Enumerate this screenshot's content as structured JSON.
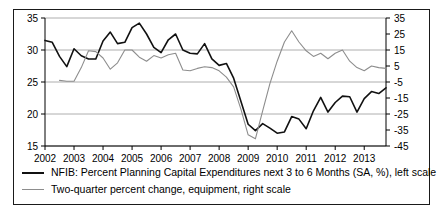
{
  "chart_data": {
    "type": "line",
    "title": "",
    "xlabel": "",
    "ylabel": "",
    "xlim": [
      2002.0,
      2013.75
    ],
    "x_ticks": [
      2002,
      2003,
      2004,
      2005,
      2006,
      2007,
      2008,
      2009,
      2010,
      2011,
      2012,
      2013
    ],
    "x_tick_labels": [
      "2002",
      "2003",
      "2004",
      "2005",
      "2006",
      "2007",
      "2008",
      "2009",
      "2010",
      "2011",
      "2012",
      "2013"
    ],
    "left_axis": {
      "label": "NFIB percent planning capital expenditures (SA, %)",
      "ylim": [
        15,
        35
      ],
      "ticks": [
        15,
        20,
        25,
        30,
        35
      ],
      "tick_labels": [
        "15",
        "20",
        "25",
        "30",
        "35"
      ]
    },
    "right_axis": {
      "label": "Two-quarter percent change, equipment",
      "ylim": [
        -45,
        35
      ],
      "ticks": [
        -45,
        -35,
        -25,
        -15,
        -5,
        5,
        15,
        25,
        35
      ],
      "tick_labels": [
        "-45",
        "-35",
        "-25",
        "-15",
        "-5",
        "5",
        "15",
        "25",
        "35"
      ]
    },
    "grid": "horizontal",
    "legend_position": "below-plot",
    "series": [
      {
        "name": "NFIB: Percent Planning Capital Expenditures next 3 to 6 Months (SA, %), left scale",
        "axis": "left",
        "color": "#111111",
        "x": [
          2002.0,
          2002.25,
          2002.5,
          2002.75,
          2003.0,
          2003.25,
          2003.5,
          2003.75,
          2004.0,
          2004.25,
          2004.5,
          2004.75,
          2005.0,
          2005.25,
          2005.5,
          2005.75,
          2006.0,
          2006.25,
          2006.5,
          2006.75,
          2007.0,
          2007.25,
          2007.5,
          2007.75,
          2008.0,
          2008.25,
          2008.5,
          2008.75,
          2009.0,
          2009.25,
          2009.5,
          2009.75,
          2010.0,
          2010.25,
          2010.5,
          2010.75,
          2011.0,
          2011.25,
          2011.5,
          2011.75,
          2012.0,
          2012.25,
          2012.5,
          2012.75,
          2013.0,
          2013.25,
          2013.5,
          2013.75
        ],
        "values": [
          31.5,
          31.2,
          29.0,
          27.4,
          30.2,
          29.1,
          28.6,
          28.6,
          31.4,
          32.8,
          31.0,
          31.2,
          33.5,
          34.2,
          32.5,
          30.4,
          29.6,
          31.6,
          32.5,
          30.0,
          29.5,
          29.4,
          31.0,
          28.6,
          27.6,
          27.9,
          25.6,
          22.0,
          18.4,
          17.4,
          18.5,
          17.8,
          17.0,
          17.2,
          19.6,
          19.2,
          17.7,
          20.5,
          22.6,
          20.3,
          21.8,
          22.8,
          22.7,
          20.3,
          22.4,
          23.5,
          23.2,
          24.1
        ]
      },
      {
        "name": "Two-quarter percent change, equipment, right scale",
        "axis": "right",
        "color": "#8d8d8d",
        "x": [
          2002.5,
          2002.75,
          2003.0,
          2003.25,
          2003.5,
          2003.75,
          2004.0,
          2004.25,
          2004.5,
          2004.75,
          2005.0,
          2005.25,
          2005.5,
          2005.75,
          2006.0,
          2006.25,
          2006.5,
          2006.75,
          2007.0,
          2007.25,
          2007.5,
          2007.75,
          2008.0,
          2008.25,
          2008.5,
          2008.75,
          2009.0,
          2009.25,
          2009.5,
          2009.75,
          2010.0,
          2010.25,
          2010.5,
          2010.75,
          2011.0,
          2011.25,
          2011.5,
          2011.75,
          2012.0,
          2012.25,
          2012.5,
          2012.75,
          2013.0,
          2013.25,
          2013.5,
          2013.75
        ],
        "values": [
          -4.0,
          -4.5,
          -4.5,
          4.0,
          14.5,
          14.0,
          10.0,
          3.0,
          7.0,
          15.0,
          15.0,
          10.5,
          8.0,
          11.5,
          10.0,
          12.0,
          13.0,
          2.5,
          2.0,
          3.5,
          4.5,
          4.0,
          2.0,
          -2.0,
          -8.0,
          -22.0,
          -38.0,
          -40.5,
          -23.0,
          -6.0,
          8.0,
          20.0,
          27.0,
          20.0,
          14.5,
          11.0,
          13.0,
          9.5,
          13.0,
          15.0,
          8.0,
          4.0,
          2.0,
          5.0,
          4.0,
          3.5
        ]
      }
    ]
  },
  "legend": {
    "entries": [
      {
        "swatch": "black-thick-line",
        "label": "NFIB: Percent Planning Capital Expenditures next 3 to 6 Months (SA, %), left scale"
      },
      {
        "swatch": "gray-thin-line",
        "label": "Two-quarter percent change, equipment, right scale"
      }
    ]
  },
  "colors": {
    "series_primary": "#111111",
    "series_secondary": "#8d8d8d",
    "gridline": "#9a9a9a",
    "axis": "#000000",
    "border": "#1a1a1a",
    "background": "#ffffff"
  }
}
